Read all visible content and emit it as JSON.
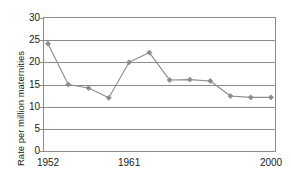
{
  "chart_data": {
    "type": "line",
    "title": "",
    "xlabel": "",
    "ylabel": "Rate per million maternities",
    "ylim": [
      0,
      30
    ],
    "ytick_values": [
      0,
      5,
      10,
      15,
      20,
      25,
      30
    ],
    "ytick_labels": [
      "0",
      "5",
      "10",
      "15",
      "20",
      "25",
      "30"
    ],
    "grid": true,
    "legend": "none",
    "series_color": "#8c8c8c",
    "marker": "diamond",
    "x_index": [
      1,
      2,
      3,
      4,
      5,
      6,
      7,
      8,
      9,
      10,
      11,
      12
    ],
    "xtick_index": [
      1,
      5,
      12
    ],
    "xtick_labels": [
      "1952",
      "1961",
      "2000"
    ],
    "categories": [
      "1952",
      "",
      "",
      "",
      "1961",
      "",
      "",
      "",
      "",
      "",
      "",
      "2000"
    ],
    "values": [
      24.2,
      15.0,
      14.2,
      12.0,
      20.0,
      22.2,
      16.0,
      16.1,
      15.8,
      12.4,
      12.1,
      12.1
    ],
    "series": [
      {
        "name": "Rate per million maternities",
        "values": [
          24.2,
          15.0,
          14.2,
          12.0,
          20.0,
          22.2,
          16.0,
          16.1,
          15.8,
          12.4,
          12.1,
          12.1
        ]
      }
    ]
  },
  "axes": {
    "y_title": "Rate per million maternities"
  }
}
